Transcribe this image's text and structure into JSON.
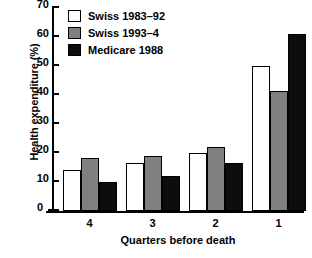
{
  "chart_data": {
    "type": "bar",
    "title": "",
    "xlabel": "Quarters before death",
    "ylabel": "Health expenditure (%)",
    "categories": [
      "4",
      "3",
      "2",
      "1"
    ],
    "series": [
      {
        "name": "Swiss 1983–92",
        "color": "#ffffff",
        "values": [
          14,
          16.5,
          20,
          50
        ]
      },
      {
        "name": "Swiss 1993–4",
        "color": "#808080",
        "values": [
          18.3,
          19,
          22,
          41.5
        ]
      },
      {
        "name": "Medicare 1988",
        "color": "#0d0d0d",
        "values": [
          10,
          12,
          16.5,
          61
        ]
      }
    ],
    "ylim": [
      0,
      70
    ],
    "yticks": [
      0,
      10,
      20,
      30,
      40,
      50,
      60,
      70
    ],
    "ytick_labels": [
      "0",
      "10",
      "20",
      "30",
      "40",
      "50",
      "60",
      "70"
    ],
    "grid": false,
    "legend_position": "top-left"
  }
}
